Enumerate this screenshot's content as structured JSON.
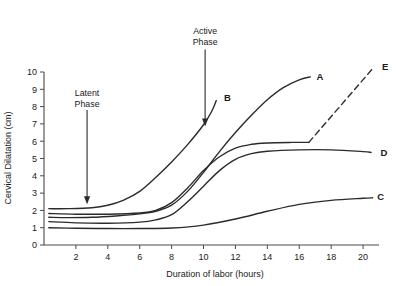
{
  "chart_data": {
    "type": "line",
    "title": "",
    "xlabel": "Duration of labor (hours)",
    "ylabel": "Cervical Dilatation (cm)",
    "xlim": [
      0,
      21
    ],
    "ylim": [
      0,
      10
    ],
    "grid": false,
    "legend_position": "curve-end-labels",
    "x_ticks": [
      "2",
      "4",
      "6",
      "8",
      "10",
      "12",
      "14",
      "16",
      "18",
      "20"
    ],
    "x_tick_values": [
      2,
      4,
      6,
      8,
      10,
      12,
      14,
      16,
      18,
      20
    ],
    "y_ticks": [
      "0",
      "1",
      "2",
      "3",
      "4",
      "5",
      "6",
      "7",
      "8",
      "9",
      "10"
    ],
    "y_tick_values": [
      0,
      1,
      2,
      3,
      4,
      5,
      6,
      7,
      8,
      9,
      10
    ],
    "line_color": "#2b2b2b",
    "axis_color": "#4a4a4a",
    "series": [
      {
        "name": "A",
        "label": "A",
        "style": "solid",
        "label_x": 16.9,
        "label_y": 9.75,
        "points": [
          [
            0.3,
            1.6
          ],
          [
            1.5,
            1.58
          ],
          [
            3.0,
            1.6
          ],
          [
            4.5,
            1.68
          ],
          [
            6.0,
            1.8
          ],
          [
            7.0,
            1.95
          ],
          [
            8.0,
            2.3
          ],
          [
            9.0,
            3.1
          ],
          [
            10.0,
            4.2
          ],
          [
            11.0,
            5.4
          ],
          [
            12.0,
            6.5
          ],
          [
            13.0,
            7.5
          ],
          [
            14.0,
            8.4
          ],
          [
            15.0,
            9.1
          ],
          [
            16.0,
            9.55
          ],
          [
            16.7,
            9.72
          ]
        ]
      },
      {
        "name": "B",
        "label": "B",
        "style": "solid",
        "label_x": 11.1,
        "label_y": 8.55,
        "points": [
          [
            0.3,
            2.1
          ],
          [
            1.5,
            2.1
          ],
          [
            3.0,
            2.15
          ],
          [
            4.0,
            2.3
          ],
          [
            5.0,
            2.6
          ],
          [
            6.0,
            3.1
          ],
          [
            7.0,
            3.9
          ],
          [
            8.0,
            4.8
          ],
          [
            9.0,
            5.8
          ],
          [
            10.0,
            6.95
          ],
          [
            10.5,
            7.7
          ],
          [
            10.8,
            8.35
          ]
        ]
      },
      {
        "name": "C",
        "label": "C",
        "style": "solid",
        "label_x": 20.7,
        "label_y": 2.78,
        "points": [
          [
            0.3,
            1.0
          ],
          [
            2.0,
            0.97
          ],
          [
            4.0,
            0.95
          ],
          [
            6.0,
            0.95
          ],
          [
            8.0,
            0.98
          ],
          [
            10.0,
            1.15
          ],
          [
            12.0,
            1.5
          ],
          [
            14.0,
            1.95
          ],
          [
            16.0,
            2.35
          ],
          [
            18.0,
            2.58
          ],
          [
            20.0,
            2.7
          ],
          [
            20.6,
            2.73
          ]
        ]
      },
      {
        "name": "D",
        "label": "D",
        "style": "solid",
        "label_x": 20.9,
        "label_y": 5.35,
        "points": [
          [
            0.3,
            1.35
          ],
          [
            2.0,
            1.28
          ],
          [
            4.0,
            1.26
          ],
          [
            6.0,
            1.32
          ],
          [
            7.0,
            1.45
          ],
          [
            8.0,
            1.75
          ],
          [
            9.0,
            2.5
          ],
          [
            10.0,
            3.4
          ],
          [
            11.0,
            4.3
          ],
          [
            12.0,
            4.95
          ],
          [
            13.0,
            5.28
          ],
          [
            14.0,
            5.42
          ],
          [
            16.0,
            5.5
          ],
          [
            18.0,
            5.5
          ],
          [
            20.0,
            5.4
          ],
          [
            20.5,
            5.35
          ]
        ]
      },
      {
        "name": "E",
        "label": "E",
        "style": "dashed-after-plateau",
        "label_x": 21.0,
        "label_y": 10.3,
        "solid_points": [
          [
            0.3,
            1.82
          ],
          [
            2.0,
            1.78
          ],
          [
            4.0,
            1.78
          ],
          [
            6.0,
            1.85
          ],
          [
            7.0,
            2.0
          ],
          [
            8.0,
            2.45
          ],
          [
            9.0,
            3.3
          ],
          [
            10.0,
            4.3
          ],
          [
            11.0,
            5.1
          ],
          [
            12.0,
            5.6
          ],
          [
            13.0,
            5.82
          ],
          [
            14.0,
            5.9
          ],
          [
            15.5,
            5.93
          ],
          [
            16.6,
            5.93
          ]
        ],
        "dashed_points": [
          [
            16.6,
            5.93
          ],
          [
            20.7,
            10.3
          ]
        ]
      }
    ],
    "annotations": [
      {
        "name": "latent-phase",
        "line1": "Latent",
        "line2": "Phase",
        "text_x": 2.7,
        "text_y": 8.6,
        "arrow_from_y": 7.8,
        "arrow_to_x": 2.7,
        "arrow_to_y": 2.35
      },
      {
        "name": "active-phase",
        "line1": "Active",
        "line2": "Phase",
        "text_x": 10.1,
        "text_y": 12.2,
        "arrow_from_y": 11.3,
        "arrow_to_x": 10.1,
        "arrow_to_y": 6.85
      }
    ]
  }
}
